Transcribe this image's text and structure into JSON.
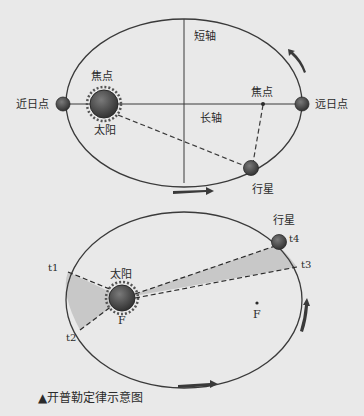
{
  "figure": {
    "caption": "▲开普勒定律示意图",
    "colors": {
      "background": "#e9e9e9",
      "line": "#3a3a3a",
      "body_fill": "#4a4a4a",
      "sector_fill": "#c8c8c8"
    }
  },
  "top_diagram": {
    "labels": {
      "minor_axis": "短轴",
      "major_axis": "长轴",
      "focus_left": "焦点",
      "focus_right": "焦点",
      "sun": "太阳",
      "perihelion": "近日点",
      "aphelion": "远日点",
      "planet": "行星"
    },
    "icons": [
      "sun-icon",
      "planet-icon",
      "perihelion-body-icon",
      "aphelion-body-icon",
      "direction-arrow-icon"
    ]
  },
  "bottom_diagram": {
    "labels": {
      "sun": "太阳",
      "sun_focus": "F",
      "empty_focus": "F",
      "planet": "行星",
      "t1": "t1",
      "t2": "t2",
      "t3": "t3",
      "t4": "t4"
    },
    "icons": [
      "sun-icon",
      "planet-icon",
      "direction-arrow-icon"
    ]
  }
}
